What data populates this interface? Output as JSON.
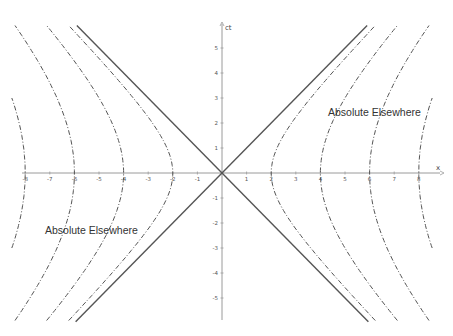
{
  "chart_data": {
    "type": "line",
    "title": "",
    "xlabel": "x",
    "ylabel": "ct",
    "xlim": [
      -8.8,
      9.2
    ],
    "ylim": [
      -6.2,
      6.1
    ],
    "grid": false,
    "x_ticks": [
      -8,
      -7,
      -6,
      -5,
      -4,
      -3,
      -2,
      -1,
      1,
      2,
      3,
      4,
      5,
      6,
      7,
      8
    ],
    "y_ticks": [
      -5,
      -4,
      -3,
      -2,
      -1,
      1,
      2,
      3,
      4,
      5
    ],
    "series": [
      {
        "name": "light cone ct = x",
        "style": "solid",
        "equation": "ct = x"
      },
      {
        "name": "light cone ct = -x",
        "style": "solid",
        "equation": "ct = -x"
      },
      {
        "name": "hyperbola a=2",
        "style": "dash-dot",
        "equation": "x^2 - (ct)^2 = 4"
      },
      {
        "name": "hyperbola a=4",
        "style": "dash-dot",
        "equation": "x^2 - (ct)^2 = 16"
      },
      {
        "name": "hyperbola a=6",
        "style": "dash-dot",
        "equation": "x^2 - (ct)^2 = 36"
      },
      {
        "name": "hyperbola a=8",
        "style": "dash-dot",
        "equation": "x^2 - (ct)^2 = 64"
      }
    ],
    "hyperbola_vertices": [
      2,
      4,
      6,
      8
    ],
    "annotations": [
      {
        "text": "Absolute Elsewhere",
        "x": 5.4,
        "y": 2.2
      },
      {
        "text": "Absolute Elsewhere",
        "x": -5.4,
        "y": -2.2
      }
    ]
  },
  "labels": {
    "right_region": "Absolute Elsewhere",
    "left_region": "Absolute Elsewhere",
    "x_axis": "x",
    "y_axis": "ct"
  },
  "colors": {
    "line": "#555555",
    "axis": "#9a9a9a",
    "text": "#333333",
    "background": "#ffffff"
  }
}
